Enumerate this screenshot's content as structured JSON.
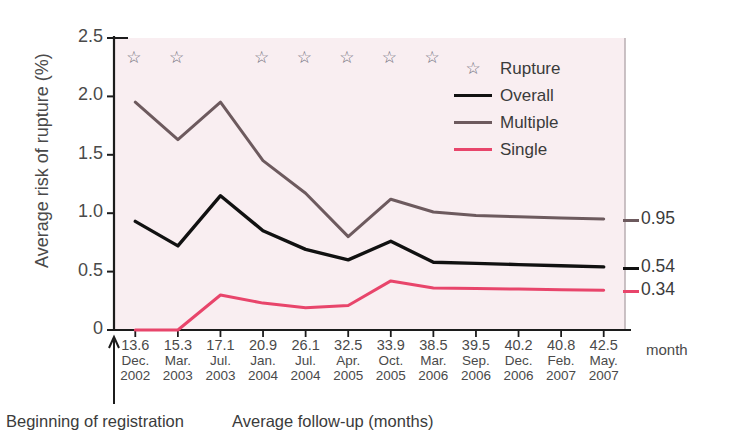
{
  "chart_data": {
    "type": "line",
    "title": "",
    "xlabel": "Average follow-up (months)",
    "ylabel": "Average risk of rupture (%)",
    "xunit_label": "month",
    "ylim": [
      0,
      2.5
    ],
    "yticks": [
      "0",
      "0.5",
      "1.0",
      "1.5",
      "2.0",
      "2.5"
    ],
    "ytick_values": [
      0,
      0.5,
      1.0,
      1.5,
      2.0,
      2.5
    ],
    "grid": false,
    "legend_position": "upper-right-inside",
    "x": [
      13.6,
      15.3,
      17.1,
      20.9,
      26.1,
      32.5,
      33.9,
      38.5,
      39.5,
      40.2,
      40.8,
      42.5
    ],
    "categories": [
      "13.6",
      "15.3",
      "17.1",
      "20.9",
      "26.1",
      "32.5",
      "33.9",
      "38.5",
      "39.5",
      "40.2",
      "40.8",
      "42.5"
    ],
    "xtick_months": [
      "Dec.",
      "Mar.",
      "Jul.",
      "Jan.",
      "Jul.",
      "Apr.",
      "Oct.",
      "Mar.",
      "Sep.",
      "Dec.",
      "Feb.",
      "May."
    ],
    "xtick_years": [
      "2002",
      "2003",
      "2003",
      "2004",
      "2004",
      "2005",
      "2005",
      "2006",
      "2006",
      "2006",
      "2007",
      "2007"
    ],
    "series": [
      {
        "name": "Overall",
        "color": "#111111",
        "values": [
          0.93,
          0.72,
          1.15,
          0.85,
          0.69,
          0.6,
          0.76,
          0.58,
          0.57,
          0.56,
          0.55,
          0.54
        ],
        "end_label": "0.54"
      },
      {
        "name": "Multiple",
        "color": "#6d5a5e",
        "values": [
          1.95,
          1.63,
          1.95,
          1.45,
          1.17,
          0.8,
          1.12,
          1.01,
          0.98,
          0.97,
          0.96,
          0.95
        ],
        "end_label": "0.95"
      },
      {
        "name": "Single",
        "color": "#e8456b",
        "values": [
          0.0,
          0.0,
          0.3,
          0.23,
          0.19,
          0.21,
          0.42,
          0.36,
          0.355,
          0.35,
          0.345,
          0.34
        ],
        "end_label": "0.34"
      }
    ],
    "rupture_markers": {
      "label": "Rupture",
      "glyph": "☆",
      "at_x": [
        13.6,
        15.3,
        20.9,
        26.1,
        32.5,
        33.9,
        38.5
      ],
      "y_level": 2.33
    },
    "annotations": [
      "Beginning of registration"
    ],
    "plot_background": "#f9eef1",
    "plot_border_color": "#b9aeb2"
  },
  "legend": {
    "items": [
      {
        "label": "Rupture",
        "key": "star",
        "color": "#6d6d7a"
      },
      {
        "label": "Overall",
        "key": "line",
        "color": "#111111"
      },
      {
        "label": "Multiple",
        "key": "line",
        "color": "#6d5a5e"
      },
      {
        "label": "Single",
        "key": "line",
        "color": "#e8456b"
      }
    ]
  },
  "footer": {
    "registration": "Beginning of registration",
    "xaxis": "Average follow-up (months)",
    "month_unit": "month"
  }
}
